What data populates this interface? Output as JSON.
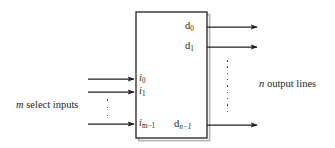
{
  "figure": {
    "type": "block-diagram",
    "background_color": "#ffffff",
    "ink_color": "#231f20",
    "shadow_color": "#b3b3b3"
  },
  "block": {
    "name": "decoder-box",
    "x": 136,
    "y": 12,
    "width": 71,
    "height": 126,
    "border_color": "#231f20",
    "fill": "#ffffff"
  },
  "inputs": {
    "caption": "m select inputs",
    "caption_italic_prefix": "m",
    "caption_rest": " select inputs",
    "arrow_start_x": 88,
    "arrow_end_x": 136,
    "ports": [
      {
        "label_base": "i",
        "label_sub": "0",
        "y": 79
      },
      {
        "label_base": "i",
        "label_sub": "1",
        "y": 92
      },
      {
        "label_base": "i",
        "label_sub": "m−1",
        "y": 124
      }
    ],
    "ellipsis_dots": 3,
    "ellipsis_x": 107,
    "ellipsis_y_top": 99,
    "ellipsis_y_bottom": 116
  },
  "outputs": {
    "caption": "n output lines",
    "caption_italic_prefix": "n",
    "caption_rest": " output lines",
    "arrow_start_x": 207,
    "arrow_end_x": 259,
    "ports": [
      {
        "label_base": "d",
        "label_sub": "0",
        "y": 27
      },
      {
        "label_base": "d",
        "label_sub": "1",
        "y": 47
      },
      {
        "label_base": "d",
        "label_sub": "n−1",
        "y": 125
      }
    ],
    "ellipsis_dots": 9,
    "ellipsis_x": 227,
    "ellipsis_y_top": 60,
    "ellipsis_y_bottom": 112
  }
}
